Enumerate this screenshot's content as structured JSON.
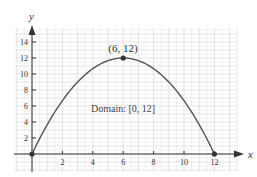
{
  "chart_data": {
    "type": "line",
    "title": "",
    "xlabel": "x",
    "ylabel": "y",
    "xlim": [
      0,
      12
    ],
    "ylim": [
      0,
      14
    ],
    "x_ticks": [
      2,
      4,
      6,
      8,
      10,
      12
    ],
    "y_ticks": [
      2,
      4,
      6,
      8,
      10,
      12,
      14
    ],
    "x_tick_labels": [
      "2",
      "4",
      "6",
      "8",
      "10",
      "12"
    ],
    "y_tick_labels": [
      "2",
      "4",
      "6",
      "8",
      "10",
      "12",
      "14"
    ],
    "grid": true,
    "series": [
      {
        "name": "parabola",
        "function": "y = 12 - (x - 6)^2 / 3",
        "x": [
          0,
          1,
          2,
          3,
          4,
          5,
          6,
          7,
          8,
          9,
          10,
          11,
          12
        ],
        "values": [
          0,
          3.67,
          6.67,
          9,
          10.67,
          11.67,
          12,
          11.67,
          10.67,
          9,
          6.67,
          3.67,
          0
        ]
      }
    ],
    "points": [
      {
        "x": 0,
        "y": 0,
        "label": ""
      },
      {
        "x": 6,
        "y": 12,
        "label": "(6, 12)"
      },
      {
        "x": 12,
        "y": 0,
        "label": ""
      }
    ],
    "annotations": [
      {
        "text": "Domain: [0, 12]",
        "x": 4,
        "y": 5.3
      }
    ],
    "colors": {
      "curve": "#555555",
      "axis": "#333333",
      "grid": "#e4e4e4",
      "text": "#333333"
    }
  },
  "labels": {
    "x_axis": "x",
    "y_axis": "y",
    "vertex": "(6, 12)",
    "domain": "Domain: [0, 12]",
    "x_ticks": [
      "2",
      "4",
      "6",
      "8",
      "10",
      "12"
    ],
    "y_ticks": [
      "2",
      "4",
      "6",
      "8",
      "10",
      "12",
      "14"
    ]
  }
}
